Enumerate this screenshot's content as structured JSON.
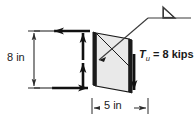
{
  "figure": {
    "panel": {
      "name": "shear-panel",
      "fill_color": "#e9e9e9",
      "edge_color": "#000000"
    },
    "dimensions": {
      "height": {
        "label": "8 in",
        "value": 8,
        "unit": "in",
        "orientation": "vertical"
      },
      "width": {
        "label": "5 in",
        "value": 5,
        "unit": "in",
        "orientation": "horizontal"
      }
    },
    "annotations": {
      "force": {
        "symbol": "T",
        "subscript": "u",
        "equals": "=",
        "magnitude": "8",
        "unit": "kips",
        "full_label": "T_u = 8 kips"
      },
      "weld_symbol": {
        "type": "fillet-weld",
        "glyph": "triangle"
      }
    },
    "force_arrows": [
      {
        "name": "top-arrow-left",
        "direction": "left"
      },
      {
        "name": "bottom-arrow-right",
        "direction": "right"
      },
      {
        "name": "left-edge-arrow-up",
        "direction": "up"
      },
      {
        "name": "right-edge-arrow-down",
        "direction": "down"
      }
    ],
    "colors": {
      "line": "#111111",
      "panel_fill": "#e9e9e9",
      "dimension_line": "#2b2b2b",
      "leader_line": "#3a3a3a",
      "background": "#ffffff"
    }
  }
}
